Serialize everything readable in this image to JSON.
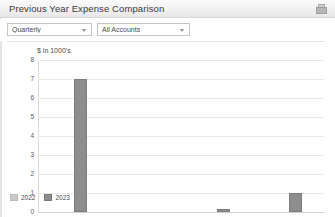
{
  "window": {
    "title": "Previous Year Expense Comparison",
    "icon": "print-icon"
  },
  "filters": {
    "period": {
      "value": "Quarterly",
      "icon": "chevron-down-icon"
    },
    "account": {
      "value": "All Accounts",
      "icon": "chevron-down-icon"
    }
  },
  "chart_data": {
    "type": "bar",
    "title": "",
    "axis_note": "$ in 1000's",
    "xlabel": "",
    "ylabel": "$ in 1000's",
    "categories": [
      "Quarter 1",
      "Quarter 2",
      "Quarter 3",
      "Quarter 4"
    ],
    "series": [
      {
        "name": "2022",
        "color": "#c9c9c9",
        "values": [
          0,
          0,
          0,
          0
        ]
      },
      {
        "name": "2023",
        "color": "#8d8d8d",
        "values": [
          7,
          0,
          0.15,
          1
        ]
      }
    ],
    "yticks": [
      8,
      7,
      6,
      5,
      4,
      3,
      2,
      1,
      0
    ],
    "ylim": [
      0,
      8
    ],
    "grid": true,
    "legend_position": "bottom-left"
  }
}
